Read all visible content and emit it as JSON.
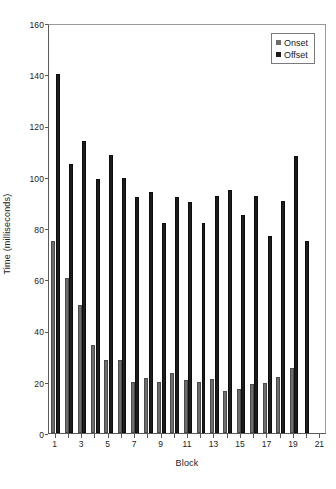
{
  "chart_data": {
    "type": "bar",
    "title": "",
    "xlabel": "Block",
    "ylabel": "Time (milliseconds)",
    "categories": [
      "1",
      "2",
      "3",
      "4",
      "5",
      "6",
      "7",
      "8",
      "9",
      "10",
      "11",
      "12",
      "13",
      "14",
      "15",
      "16",
      "17",
      "18",
      "19",
      "20",
      "21"
    ],
    "xtick_labels": [
      "1",
      "3",
      "5",
      "7",
      "9",
      "11",
      "13",
      "15",
      "17",
      "19",
      "21"
    ],
    "ylim": [
      0,
      160
    ],
    "ytick_values": [
      0,
      20,
      40,
      60,
      80,
      100,
      120,
      140,
      160
    ],
    "ytick_labels": [
      "0",
      "20",
      "40",
      "60",
      "80",
      "100",
      "120",
      "140",
      "160"
    ],
    "grid": false,
    "legend_position": "top-right",
    "series": [
      {
        "name": "Onset",
        "color": "#6d6d6d",
        "values": [
          75,
          60.5,
          50,
          34.5,
          28.5,
          28.5,
          20,
          21.5,
          20,
          23.5,
          20.5,
          20,
          21,
          16.5,
          17,
          19,
          19.5,
          22,
          25.5,
          0,
          0
        ]
      },
      {
        "name": "Offset",
        "color": "#1c1c1c",
        "values": [
          140,
          105,
          114,
          99,
          108.5,
          99.5,
          92,
          94,
          82,
          92,
          90,
          82,
          92.5,
          95,
          85,
          92.5,
          77,
          90.5,
          108,
          75,
          0
        ]
      }
    ]
  },
  "legend": {
    "items": [
      {
        "label": "Onset",
        "swatch": "onset-swatch"
      },
      {
        "label": "Offset",
        "swatch": "offset-swatch"
      }
    ]
  },
  "caption": {
    "text": ""
  }
}
